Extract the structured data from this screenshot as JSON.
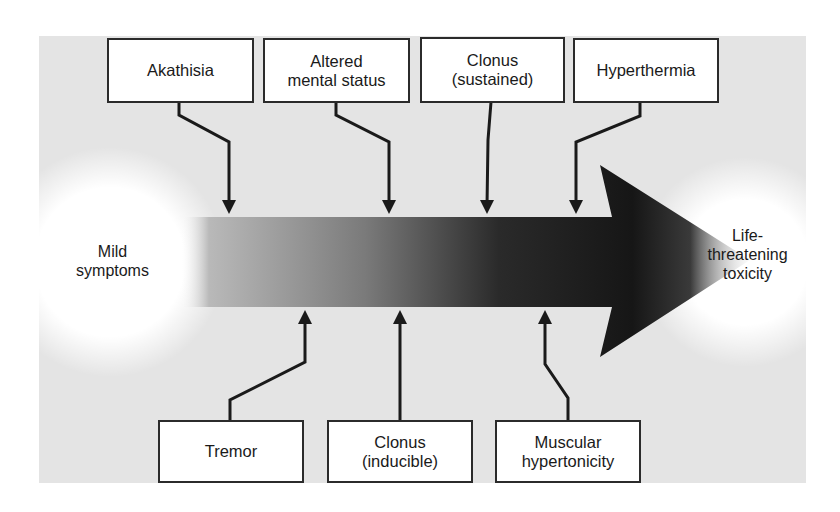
{
  "diagram": {
    "start_label": "Mild\nsymptoms",
    "end_label": "Life-\nthreatening\ntoxicity",
    "arrow": {
      "gradient_start": "#bdbdbd",
      "gradient_mid": "#6a6a6a",
      "gradient_end": "#151515"
    },
    "colors": {
      "background_panel": "#e4e4e4",
      "box_border": "#2b2b2b",
      "connector": "#1a1a1a"
    },
    "top_boxes": [
      {
        "id": "akathisia",
        "label": "Akathisia"
      },
      {
        "id": "altered-mental-status",
        "label": "Altered\nmental status"
      },
      {
        "id": "clonus-sustained",
        "label": "Clonus\n(sustained)"
      },
      {
        "id": "hyperthermia",
        "label": "Hyperthermia"
      }
    ],
    "bottom_boxes": [
      {
        "id": "tremor",
        "label": "Tremor"
      },
      {
        "id": "clonus-inducible",
        "label": "Clonus\n(inducible)"
      },
      {
        "id": "muscular-hypertonicity",
        "label": "Muscular\nhypertonicity"
      }
    ]
  }
}
